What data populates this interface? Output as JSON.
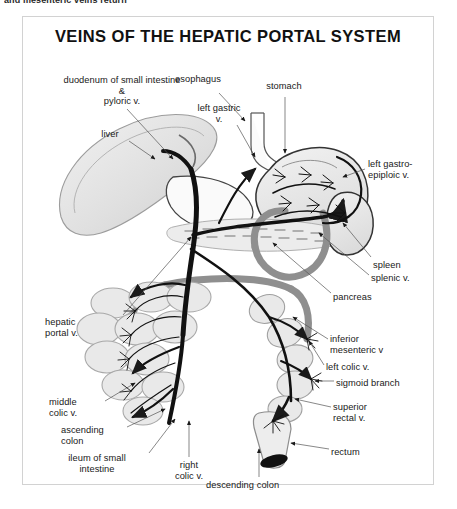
{
  "page": {
    "top_caption": "and mesenteric veins return",
    "background": "#ffffff"
  },
  "figure": {
    "title": "VEINS OF THE HEPATIC PORTAL SYSTEM",
    "frame_color": "#d2d2d2",
    "ink_color": "#111111",
    "organ_fill": "#e8e8e8",
    "vessel_gray": "#9a9a9a",
    "labels": [
      {
        "id": "duodenum",
        "text": "duodenum of small intestine\n&\npyloric v.",
        "x": 48,
        "y": 58,
        "align": "center"
      },
      {
        "id": "esophagus",
        "text": "esophagus",
        "x": 175,
        "y": 57,
        "align": "center"
      },
      {
        "id": "stomach",
        "text": "stomach",
        "x": 258,
        "y": 64,
        "align": "center"
      },
      {
        "id": "left-gastric-v",
        "text": "left gastric\nv.",
        "x": 195,
        "y": 86,
        "align": "center"
      },
      {
        "id": "liver",
        "text": "liver",
        "x": 88,
        "y": 112,
        "align": "center"
      },
      {
        "id": "left-gastroepiploic-v",
        "text": "left gastro-\nepiploic v.",
        "x": 345,
        "y": 142,
        "align": "left"
      },
      {
        "id": "spleen",
        "text": "spleen",
        "x": 350,
        "y": 243,
        "align": "left"
      },
      {
        "id": "splenic-v",
        "text": "splenic v.",
        "x": 348,
        "y": 256,
        "align": "left"
      },
      {
        "id": "pancreas",
        "text": "pancreas",
        "x": 310,
        "y": 275,
        "align": "left"
      },
      {
        "id": "hepatic-portal-v",
        "text": "hepatic\nportal v.",
        "x": 44,
        "y": 300,
        "align": "left"
      },
      {
        "id": "inferior-mesenteric-v",
        "text": "inferior\nmesenteric v",
        "x": 307,
        "y": 317,
        "align": "left"
      },
      {
        "id": "left-colic-v",
        "text": "left colic v.",
        "x": 303,
        "y": 345,
        "align": "left"
      },
      {
        "id": "sigmoid-branch",
        "text": "sigmoid branch",
        "x": 313,
        "y": 361,
        "align": "left"
      },
      {
        "id": "middle-colic-v",
        "text": "middle\ncolic v.",
        "x": 48,
        "y": 380,
        "align": "left"
      },
      {
        "id": "superior-rectal-v",
        "text": "superior\nrectal v.",
        "x": 310,
        "y": 385,
        "align": "left"
      },
      {
        "id": "ascending-colon",
        "text": "ascending\ncolon",
        "x": 60,
        "y": 408,
        "align": "left"
      },
      {
        "id": "rectum",
        "text": "rectum",
        "x": 308,
        "y": 430,
        "align": "left"
      },
      {
        "id": "ileum",
        "text": "ileum of small\nintestine",
        "x": 57,
        "y": 436,
        "align": "left"
      },
      {
        "id": "right-colic-v",
        "text": "right\ncolic v.",
        "x": 152,
        "y": 443,
        "align": "left"
      },
      {
        "id": "descending-colon",
        "text": "descending colon",
        "x": 205,
        "y": 463,
        "align": "left"
      }
    ]
  }
}
